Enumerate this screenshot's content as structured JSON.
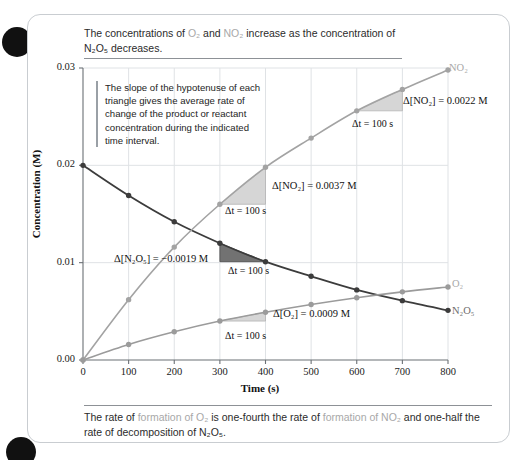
{
  "page": {
    "top_caption_part1": "The concentrations of ",
    "top_caption_o2": "O₂",
    "top_caption_part2": " and ",
    "top_caption_no2": "NO₂",
    "top_caption_part3": " increase as the concentration of N₂O₅ decreases.",
    "bottom_caption_part1": "The rate of ",
    "bottom_caption_o2": "formation of O₂",
    "bottom_caption_part2": " is one-fourth the rate of ",
    "bottom_caption_no2": "formation of NO₂",
    "bottom_caption_part3": " and one-half the rate of decomposition of N₂O₅."
  },
  "note": {
    "text": "The slope of the hypotenuse of each triangle gives the average rate of change of the product or reactant concentration during the indicated time interval."
  },
  "annotations": [
    {
      "id": "no2-700",
      "delta": "Δ[NO₂] = 0.0022 M",
      "dt": "Δt = 100 s"
    },
    {
      "id": "no2-300",
      "delta": "Δ[NO₂] = 0.0037 M",
      "dt": "Δt = 100 s"
    },
    {
      "id": "n2o5-300",
      "delta": "Δ[N₂O₅] = −0.0019 M",
      "dt": "Δt = 100 s"
    },
    {
      "id": "o2-300",
      "delta": "Δ[O₂] = 0.0009 M",
      "dt": "Δt = 100 s"
    }
  ],
  "series_tags": {
    "no2": "NO₂",
    "o2": "O₂",
    "n2o5": "N₂O₅"
  },
  "colors": {
    "no2": "#a3a3a3",
    "o2": "#9b9b9b",
    "n2o5": "#3c3c3c",
    "grid": "#dfe2e5",
    "axis": "#6b7075",
    "triangle_light": "#cfcfcf",
    "triangle_dark": "#6a6a6a",
    "card_border": "#c9cdd1"
  },
  "chart_data": {
    "type": "line",
    "title": "",
    "xlabel": "Time (s)",
    "ylabel": "Concentration (M)",
    "xlim": [
      0,
      800
    ],
    "ylim": [
      0.0,
      0.03
    ],
    "xticks": [
      0,
      100,
      200,
      300,
      400,
      500,
      600,
      700,
      800
    ],
    "yticks": [
      "0.00",
      "0.01",
      "0.02",
      "0.03"
    ],
    "ytick_values": [
      0.0,
      0.01,
      0.02,
      0.03
    ],
    "grid": true,
    "legend": "inline-right-labels",
    "x": [
      0,
      100,
      200,
      300,
      400,
      500,
      600,
      700,
      800
    ],
    "series": [
      {
        "name": "N₂O₅",
        "color": "#3c3c3c",
        "values": [
          0.02,
          0.0169,
          0.0142,
          0.012,
          0.0101,
          0.0086,
          0.0072,
          0.0061,
          0.0051
        ]
      },
      {
        "name": "NO₂",
        "color": "#a3a3a3",
        "values": [
          0.0,
          0.0062,
          0.0116,
          0.016,
          0.0198,
          0.0228,
          0.0256,
          0.0278,
          0.0298
        ]
      },
      {
        "name": "O₂",
        "color": "#9b9b9b",
        "values": [
          0.0,
          0.0016,
          0.0029,
          0.004,
          0.0049,
          0.0057,
          0.0064,
          0.007,
          0.0075
        ]
      }
    ],
    "triangles": [
      {
        "series": "NO₂",
        "x0": 600,
        "x1": 700,
        "y0": 0.0256,
        "y1": 0.0278,
        "delta": 0.0022,
        "dt": 100
      },
      {
        "series": "NO₂",
        "x0": 300,
        "x1": 400,
        "y0": 0.016,
        "y1": 0.0198,
        "delta": 0.0037,
        "dt": 100
      },
      {
        "series": "N₂O₅",
        "x0": 300,
        "x1": 400,
        "y0": 0.012,
        "y1": 0.0101,
        "delta": -0.0019,
        "dt": 100
      },
      {
        "series": "O₂",
        "x0": 300,
        "x1": 400,
        "y0": 0.004,
        "y1": 0.0049,
        "delta": 0.0009,
        "dt": 100
      }
    ]
  }
}
